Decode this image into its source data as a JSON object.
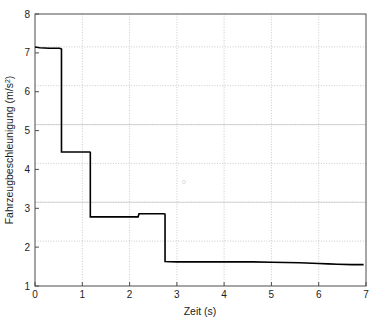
{
  "chart_data": {
    "type": "line",
    "title": "",
    "subtitle": "",
    "xlabel": "Zeit (s)",
    "ylabel": "Fahrzeugbeschleunigung (m/s²)",
    "ylabel_base": "Fahrzeugbeschleunigung (m/s",
    "ylabel_sup": "2",
    "ylabel_close": ")",
    "xlim": [
      0,
      7
    ],
    "ylim": [
      1,
      8
    ],
    "xticks": [
      0,
      1,
      2,
      3,
      4,
      5,
      6,
      7
    ],
    "yticks": [
      1,
      2,
      3,
      4,
      5,
      6,
      7,
      8
    ],
    "xtick_labels": [
      "0",
      "1",
      "2",
      "3",
      "4",
      "5",
      "6",
      "7"
    ],
    "ytick_labels": [
      "1",
      "2",
      "3",
      "4",
      "5",
      "6",
      "7",
      "8"
    ],
    "grid": true,
    "grid_style": "dotted-minor-and-solid-major",
    "legend": null,
    "legend_position": "none",
    "line_color": "#000000",
    "line_width": 1.6,
    "step_style": "post",
    "series": [
      {
        "name": "Fahrzeugbeschleunigung",
        "x": [
          0.0,
          0.1,
          0.3,
          0.52,
          0.56,
          0.56,
          1.0,
          1.15,
          1.17,
          1.17,
          1.6,
          2.0,
          2.18,
          2.2,
          2.2,
          2.5,
          2.72,
          2.75,
          2.75,
          3.0,
          3.6,
          4.0,
          4.6,
          5.0,
          5.6,
          6.0,
          6.2,
          6.4,
          6.7,
          6.95
        ],
        "y": [
          7.15,
          7.13,
          7.12,
          7.12,
          7.1,
          4.45,
          4.45,
          4.45,
          4.44,
          2.78,
          2.78,
          2.78,
          2.78,
          2.86,
          2.86,
          2.86,
          2.86,
          2.85,
          1.63,
          1.62,
          1.62,
          1.62,
          1.62,
          1.61,
          1.6,
          1.58,
          1.57,
          1.56,
          1.55,
          1.55
        ]
      }
    ],
    "key_points": {
      "initial_value": 7.15,
      "plateau_1": 7.12,
      "plateau_2": 4.45,
      "plateau_3": 2.78,
      "plateau_4": 2.86,
      "plateau_5": 1.62,
      "final_value": 1.55,
      "drop_times": [
        0.56,
        1.17,
        2.75
      ],
      "rise_time": 2.2
    }
  },
  "axes": {
    "frame_color": "#555555",
    "grid_major_color": "#b5b5b5",
    "grid_minor_color": "#c8c8c8"
  }
}
